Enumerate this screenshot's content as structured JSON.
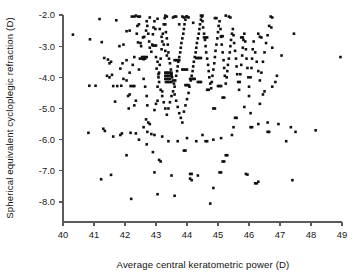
{
  "chart_data": {
    "type": "scatter",
    "title": "",
    "xlabel": "Average central keratometric power (D)",
    "ylabel": "Spherical equivalent cycloplegic refraction (D)",
    "xlim": [
      40,
      49
    ],
    "ylim": [
      -8.0,
      -2.0
    ],
    "xticks": [
      40,
      41,
      42,
      43,
      44,
      45,
      46,
      47,
      48,
      49
    ],
    "xtick_labels": [
      "40",
      "41",
      "42",
      "43",
      "44",
      "45",
      "46",
      "47",
      "48",
      "49"
    ],
    "yticks": [
      -2.0,
      -3.0,
      -4.0,
      -5.0,
      -6.0,
      -7.0,
      -8.0
    ],
    "ytick_labels": [
      "-2.0",
      "-3.0",
      "-4.0",
      "-5.0",
      "-6.0",
      "-7.0",
      "-8.0"
    ],
    "grid": false,
    "legend": false,
    "marker": "square",
    "marker_color": "#111111",
    "marker_size": 2.6,
    "n_points": 392,
    "points": [
      [
        40.32,
        -2.63
      ],
      [
        40.87,
        -2.78
      ],
      [
        41.25,
        -2.87
      ],
      [
        41.23,
        -7.27
      ],
      [
        41.18,
        -2.13
      ],
      [
        40.85,
        -4.27
      ],
      [
        41.05,
        -4.27
      ],
      [
        40.82,
        -5.78
      ],
      [
        41.33,
        -3.38
      ],
      [
        41.45,
        -3.43
      ],
      [
        41.5,
        -3.55
      ],
      [
        41.55,
        -3.5
      ],
      [
        41.42,
        -3.95
      ],
      [
        41.5,
        -4.0
      ],
      [
        41.58,
        -3.92
      ],
      [
        41.62,
        -4.28
      ],
      [
        41.3,
        -5.65
      ],
      [
        41.35,
        -5.72
      ],
      [
        41.62,
        -5.9
      ],
      [
        41.55,
        -7.13
      ],
      [
        41.72,
        -2.17
      ],
      [
        41.82,
        -3.0
      ],
      [
        41.75,
        -4.28
      ],
      [
        41.88,
        -4.27
      ],
      [
        41.92,
        -3.55
      ],
      [
        41.95,
        -2.95
      ],
      [
        42.05,
        -4.1
      ],
      [
        42.1,
        -4.6
      ],
      [
        42.12,
        -5.0
      ],
      [
        42.15,
        -4.55
      ],
      [
        42.18,
        -5.78
      ],
      [
        42.2,
        -7.9
      ],
      [
        42.05,
        -2.52
      ],
      [
        42.15,
        -2.5
      ],
      [
        42.22,
        -2.05
      ],
      [
        42.3,
        -2.05
      ],
      [
        42.35,
        -2.02
      ],
      [
        42.38,
        -2.6
      ],
      [
        42.4,
        -2.35
      ],
      [
        42.45,
        -2.3
      ],
      [
        42.42,
        -2.88
      ],
      [
        42.5,
        -2.9
      ],
      [
        42.55,
        -3.4
      ],
      [
        42.48,
        -3.4
      ],
      [
        42.6,
        -3.42
      ],
      [
        42.65,
        -3.4
      ],
      [
        42.52,
        -3.0
      ],
      [
        42.58,
        -2.72
      ],
      [
        42.62,
        -2.7
      ],
      [
        42.68,
        -2.5
      ],
      [
        42.7,
        -2.2
      ],
      [
        42.72,
        -2.35
      ],
      [
        42.75,
        -2.6
      ],
      [
        42.78,
        -2.85
      ],
      [
        42.8,
        -3.05
      ],
      [
        42.85,
        -3.18
      ],
      [
        42.88,
        -2.95
      ],
      [
        42.9,
        -2.62
      ],
      [
        42.92,
        -2.4
      ],
      [
        42.95,
        -2.2
      ],
      [
        42.98,
        -2.45
      ],
      [
        42.6,
        -4.05
      ],
      [
        42.65,
        -4.3
      ],
      [
        42.7,
        -4.6
      ],
      [
        42.72,
        -4.9
      ],
      [
        42.68,
        -5.35
      ],
      [
        42.75,
        -5.45
      ],
      [
        42.8,
        -5.5
      ],
      [
        42.72,
        -5.75
      ],
      [
        42.85,
        -5.82
      ],
      [
        42.7,
        -6.15
      ],
      [
        42.9,
        -6.4
      ],
      [
        42.95,
        -5.05
      ],
      [
        43.0,
        -4.85
      ],
      [
        43.05,
        -4.3
      ],
      [
        43.08,
        -4.0
      ],
      [
        43.1,
        -3.85
      ],
      [
        43.12,
        -3.6
      ],
      [
        43.15,
        -3.4
      ],
      [
        43.18,
        -3.1
      ],
      [
        43.2,
        -2.85
      ],
      [
        43.22,
        -2.6
      ],
      [
        43.25,
        -2.3
      ],
      [
        43.28,
        -2.1
      ],
      [
        43.3,
        -2.3
      ],
      [
        43.32,
        -2.55
      ],
      [
        43.35,
        -2.75
      ],
      [
        43.38,
        -2.95
      ],
      [
        43.4,
        -3.2
      ],
      [
        43.42,
        -3.4
      ],
      [
        43.45,
        -3.55
      ],
      [
        43.48,
        -3.75
      ],
      [
        43.5,
        -3.9
      ],
      [
        43.52,
        -4.0
      ],
      [
        43.55,
        -4.1
      ],
      [
        43.58,
        -4.2
      ],
      [
        43.6,
        -4.3
      ],
      [
        43.62,
        -4.1
      ],
      [
        43.65,
        -3.95
      ],
      [
        43.68,
        -3.8
      ],
      [
        43.7,
        -3.65
      ],
      [
        43.72,
        -3.5
      ],
      [
        43.75,
        -3.35
      ],
      [
        43.78,
        -3.2
      ],
      [
        43.8,
        -3.05
      ],
      [
        43.82,
        -2.9
      ],
      [
        43.85,
        -2.75
      ],
      [
        43.88,
        -2.6
      ],
      [
        43.9,
        -2.45
      ],
      [
        43.92,
        -2.3
      ],
      [
        43.95,
        -2.15
      ],
      [
        43.98,
        -2.05
      ],
      [
        43.05,
        -2.12
      ],
      [
        43.12,
        -2.45
      ],
      [
        43.18,
        -2.7
      ],
      [
        43.25,
        -2.95
      ],
      [
        43.3,
        -3.15
      ],
      [
        43.35,
        -3.3
      ],
      [
        43.0,
        -3.35
      ],
      [
        43.05,
        -3.5
      ],
      [
        43.02,
        -3.72
      ],
      [
        43.08,
        -3.9
      ],
      [
        43.1,
        -4.15
      ],
      [
        43.15,
        -4.4
      ],
      [
        43.2,
        -4.6
      ],
      [
        43.25,
        -4.8
      ],
      [
        43.3,
        -5.0
      ],
      [
        43.35,
        -5.2
      ],
      [
        43.4,
        -5.0
      ],
      [
        43.45,
        -4.8
      ],
      [
        43.5,
        -4.6
      ],
      [
        43.55,
        -4.45
      ],
      [
        43.6,
        -4.55
      ],
      [
        43.65,
        -4.75
      ],
      [
        43.7,
        -4.95
      ],
      [
        43.75,
        -5.15
      ],
      [
        43.8,
        -5.3
      ],
      [
        43.85,
        -5.45
      ],
      [
        43.9,
        -5.1
      ],
      [
        43.95,
        -4.9
      ],
      [
        44.0,
        -4.7
      ],
      [
        44.05,
        -4.5
      ],
      [
        44.08,
        -4.3
      ],
      [
        44.12,
        -4.1
      ],
      [
        44.15,
        -3.95
      ],
      [
        44.18,
        -3.8
      ],
      [
        44.2,
        -3.65
      ],
      [
        44.22,
        -3.5
      ],
      [
        44.25,
        -3.35
      ],
      [
        44.28,
        -3.2
      ],
      [
        44.3,
        -3.05
      ],
      [
        44.32,
        -2.9
      ],
      [
        44.35,
        -2.75
      ],
      [
        44.38,
        -2.6
      ],
      [
        44.4,
        -2.45
      ],
      [
        44.42,
        -2.3
      ],
      [
        44.45,
        -2.15
      ],
      [
        44.48,
        -2.05
      ],
      [
        44.5,
        -2.2
      ],
      [
        44.52,
        -2.4
      ],
      [
        44.55,
        -2.6
      ],
      [
        44.58,
        -2.8
      ],
      [
        44.6,
        -3.0
      ],
      [
        44.62,
        -3.2
      ],
      [
        44.65,
        -3.4
      ],
      [
        44.68,
        -3.6
      ],
      [
        44.7,
        -3.8
      ],
      [
        44.72,
        -4.0
      ],
      [
        44.75,
        -4.2
      ],
      [
        44.78,
        -4.35
      ],
      [
        44.8,
        -4.15
      ],
      [
        44.82,
        -3.95
      ],
      [
        44.85,
        -3.75
      ],
      [
        44.88,
        -3.55
      ],
      [
        44.9,
        -3.35
      ],
      [
        44.92,
        -3.15
      ],
      [
        44.95,
        -2.95
      ],
      [
        44.98,
        -2.75
      ],
      [
        45.0,
        -2.55
      ],
      [
        45.02,
        -2.35
      ],
      [
        45.05,
        -2.2
      ],
      [
        45.08,
        -2.45
      ],
      [
        45.1,
        -2.7
      ],
      [
        45.12,
        -2.95
      ],
      [
        45.15,
        -3.2
      ],
      [
        45.18,
        -3.45
      ],
      [
        45.2,
        -3.7
      ],
      [
        45.22,
        -3.95
      ],
      [
        45.25,
        -4.2
      ],
      [
        45.28,
        -4.0
      ],
      [
        45.3,
        -3.8
      ],
      [
        45.32,
        -3.6
      ],
      [
        45.35,
        -3.4
      ],
      [
        45.38,
        -3.2
      ],
      [
        45.4,
        -3.0
      ],
      [
        45.42,
        -2.8
      ],
      [
        45.45,
        -2.6
      ],
      [
        45.48,
        -2.45
      ],
      [
        45.5,
        -2.65
      ],
      [
        45.52,
        -2.9
      ],
      [
        45.55,
        -3.15
      ],
      [
        45.58,
        -3.4
      ],
      [
        45.6,
        -3.65
      ],
      [
        45.62,
        -3.9
      ],
      [
        45.65,
        -4.15
      ],
      [
        45.68,
        -4.4
      ],
      [
        45.7,
        -4.15
      ],
      [
        45.72,
        -3.9
      ],
      [
        45.75,
        -3.6
      ],
      [
        45.78,
        -3.3
      ],
      [
        45.8,
        -3.05
      ],
      [
        45.82,
        -2.8
      ],
      [
        45.85,
        -2.6
      ],
      [
        45.88,
        -2.85
      ],
      [
        45.9,
        -3.1
      ],
      [
        45.92,
        -3.4
      ],
      [
        45.95,
        -3.7
      ],
      [
        45.98,
        -4.0
      ],
      [
        46.0,
        -4.3
      ],
      [
        46.05,
        -4.0
      ],
      [
        46.08,
        -3.7
      ],
      [
        46.1,
        -3.4
      ],
      [
        46.12,
        -3.1
      ],
      [
        46.15,
        -2.85
      ],
      [
        46.2,
        -3.2
      ],
      [
        46.25,
        -3.5
      ],
      [
        46.3,
        -3.8
      ],
      [
        46.35,
        -4.1
      ],
      [
        46.4,
        -3.85
      ],
      [
        46.45,
        -3.5
      ],
      [
        46.5,
        -3.2
      ],
      [
        46.55,
        -2.9
      ],
      [
        46.6,
        -2.65
      ],
      [
        46.65,
        -2.35
      ],
      [
        46.7,
        -2.05
      ],
      [
        46.72,
        -2.4
      ],
      [
        46.75,
        -3.05
      ],
      [
        46.3,
        -2.6
      ],
      [
        46.35,
        -2.7
      ],
      [
        46.4,
        -2.72
      ],
      [
        44.0,
        -2.05
      ],
      [
        44.05,
        -2.08
      ],
      [
        43.6,
        -2.05
      ],
      [
        43.65,
        -2.05
      ],
      [
        42.42,
        -2.05
      ],
      [
        42.48,
        -2.05
      ],
      [
        45.35,
        -2.05
      ],
      [
        45.4,
        -2.08
      ],
      [
        44.9,
        -2.1
      ],
      [
        44.95,
        -2.1
      ],
      [
        43.85,
        -2.05
      ],
      [
        43.9,
        -2.08
      ],
      [
        43.3,
        -2.02
      ],
      [
        43.35,
        -2.05
      ],
      [
        43.3,
        -3.85
      ],
      [
        43.35,
        -3.85
      ],
      [
        43.4,
        -3.85
      ],
      [
        43.45,
        -3.85
      ],
      [
        43.5,
        -3.85
      ],
      [
        43.3,
        -3.95
      ],
      [
        43.35,
        -3.95
      ],
      [
        43.4,
        -3.95
      ],
      [
        43.45,
        -3.95
      ],
      [
        43.5,
        -3.95
      ],
      [
        43.3,
        -4.05
      ],
      [
        43.35,
        -4.05
      ],
      [
        43.4,
        -4.05
      ],
      [
        43.45,
        -4.05
      ],
      [
        43.32,
        -4.15
      ],
      [
        43.38,
        -4.15
      ],
      [
        43.44,
        -4.15
      ],
      [
        43.5,
        -4.15
      ],
      [
        43.6,
        -3.45
      ],
      [
        43.65,
        -3.45
      ],
      [
        43.7,
        -3.45
      ],
      [
        43.75,
        -3.45
      ],
      [
        43.85,
        -3.75
      ],
      [
        43.9,
        -3.75
      ],
      [
        43.95,
        -3.75
      ],
      [
        44.0,
        -3.75
      ],
      [
        44.1,
        -4.05
      ],
      [
        44.15,
        -4.05
      ],
      [
        44.2,
        -4.05
      ],
      [
        44.25,
        -4.05
      ],
      [
        44.35,
        -4.15
      ],
      [
        44.4,
        -4.15
      ],
      [
        44.45,
        -4.15
      ],
      [
        42.55,
        -3.35
      ],
      [
        42.6,
        -3.35
      ],
      [
        42.65,
        -3.35
      ],
      [
        42.7,
        -3.35
      ],
      [
        42.9,
        -2.98
      ],
      [
        42.95,
        -2.98
      ],
      [
        43.0,
        -2.98
      ],
      [
        44.55,
        -2.72
      ],
      [
        44.6,
        -2.72
      ],
      [
        44.65,
        -2.72
      ],
      [
        45.1,
        -2.68
      ],
      [
        45.15,
        -2.68
      ],
      [
        45.75,
        -2.72
      ],
      [
        45.8,
        -2.72
      ],
      [
        44.3,
        -3.38
      ],
      [
        44.35,
        -3.38
      ],
      [
        44.4,
        -3.38
      ],
      [
        44.45,
        -3.38
      ],
      [
        43.95,
        -4.25
      ],
      [
        44.0,
        -4.25
      ],
      [
        44.05,
        -4.25
      ],
      [
        45.0,
        -4.28
      ],
      [
        45.05,
        -4.28
      ],
      [
        45.1,
        -4.28
      ],
      [
        44.65,
        -4.4
      ],
      [
        44.7,
        -4.4
      ],
      [
        42.18,
        -4.28
      ],
      [
        42.25,
        -4.28
      ],
      [
        42.3,
        -4.28
      ],
      [
        45.15,
        -4.65
      ],
      [
        45.2,
        -4.65
      ],
      [
        44.85,
        -5.0
      ],
      [
        44.9,
        -5.0
      ],
      [
        45.55,
        -5.3
      ],
      [
        45.6,
        -5.3
      ],
      [
        46.05,
        -5.6
      ],
      [
        46.1,
        -5.6
      ],
      [
        46.6,
        -5.75
      ],
      [
        46.65,
        -5.75
      ],
      [
        44.6,
        -6.05
      ],
      [
        44.65,
        -6.05
      ],
      [
        43.9,
        -6.35
      ],
      [
        43.95,
        -6.35
      ],
      [
        45.25,
        -6.5
      ],
      [
        45.3,
        -6.5
      ],
      [
        45.15,
        -6.7
      ],
      [
        45.2,
        -6.7
      ],
      [
        44.1,
        -7.1
      ],
      [
        44.15,
        -7.1
      ],
      [
        45.05,
        -7.05
      ],
      [
        45.1,
        -7.05
      ],
      [
        46.2,
        -7.4
      ],
      [
        46.25,
        -7.4
      ],
      [
        43.05,
        -7.75
      ],
      [
        43.6,
        -7.8
      ],
      [
        44.75,
        -8.05
      ],
      [
        42.05,
        -6.5
      ],
      [
        43.1,
        -6.65
      ],
      [
        43.15,
        -6.7
      ],
      [
        42.95,
        -7.05
      ],
      [
        43.5,
        -7.15
      ],
      [
        44.35,
        -7.15
      ],
      [
        44.1,
        -7.25
      ],
      [
        44.15,
        -7.3
      ],
      [
        44.85,
        -7.55
      ],
      [
        45.9,
        -7.1
      ],
      [
        45.95,
        -7.12
      ],
      [
        46.3,
        -7.35
      ],
      [
        47.4,
        -7.3
      ],
      [
        47.2,
        -6.05
      ],
      [
        47.5,
        -5.75
      ],
      [
        48.15,
        -5.7
      ],
      [
        47.35,
        -5.6
      ],
      [
        46.95,
        -5.5
      ],
      [
        46.6,
        -5.45
      ],
      [
        46.3,
        -5.5
      ],
      [
        46.05,
        -5.15
      ],
      [
        46.35,
        -4.85
      ],
      [
        46.0,
        -4.6
      ],
      [
        45.85,
        -4.95
      ],
      [
        45.5,
        -5.6
      ],
      [
        45.45,
        -5.85
      ],
      [
        45.1,
        -5.95
      ],
      [
        44.85,
        -6.0
      ],
      [
        44.5,
        -5.85
      ],
      [
        44.3,
        -6.05
      ],
      [
        44.0,
        -5.95
      ],
      [
        43.7,
        -6.05
      ],
      [
        43.4,
        -6.05
      ],
      [
        43.2,
        -5.9
      ],
      [
        42.95,
        -5.85
      ],
      [
        42.6,
        -5.6
      ],
      [
        46.85,
        -4.15
      ],
      [
        47.05,
        -3.3
      ],
      [
        47.45,
        -2.6
      ],
      [
        48.95,
        -3.35
      ],
      [
        46.45,
        -4.55
      ],
      [
        46.5,
        -4.45
      ],
      [
        46.75,
        -4.3
      ],
      [
        46.9,
        -3.95
      ],
      [
        41.9,
        -5.8
      ],
      [
        41.85,
        -5.85
      ],
      [
        42.35,
        -5.8
      ],
      [
        42.45,
        -6.0
      ],
      [
        43.05,
        -4.75
      ],
      [
        43.2,
        -4.45
      ],
      [
        42.35,
        -4.75
      ],
      [
        42.3,
        -4.9
      ],
      [
        41.68,
        -4.78
      ],
      [
        41.95,
        -4.05
      ],
      [
        42.05,
        -3.45
      ],
      [
        42.3,
        -3.35
      ],
      [
        42.25,
        -3.6
      ],
      [
        42.45,
        -3.75
      ],
      [
        42.15,
        -3.85
      ],
      [
        41.85,
        -3.72
      ],
      [
        44.45,
        -2.02
      ],
      [
        44.5,
        -2.02
      ],
      [
        45.25,
        -2.02
      ],
      [
        42.8,
        -2.08
      ],
      [
        43.55,
        -2.08
      ],
      [
        46.75,
        -2.08
      ],
      [
        44.2,
        -2.25
      ],
      [
        43.75,
        -2.3
      ]
    ]
  },
  "axes": {
    "x_title": "Average central keratometric power (D)",
    "y_title": "Spherical equivalent cycloplegic refraction (D)"
  }
}
